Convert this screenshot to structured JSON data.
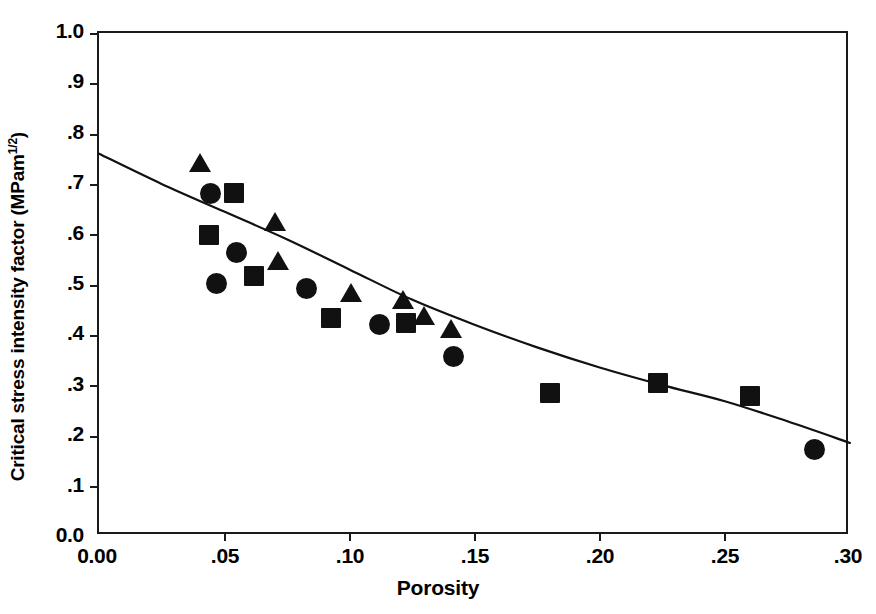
{
  "figure": {
    "title": "",
    "background": "#ffffff",
    "ink_color": "#111111"
  },
  "axes": {
    "x_title": "Porosity",
    "y_title_main": "Critical stress intensity factor   (MPam",
    "y_title_sup": "1/2",
    "y_title_close": ")",
    "x_ticks": [
      "0.00",
      ".05",
      ".10",
      ".15",
      ".20",
      ".25",
      ".30"
    ],
    "y_ticks": [
      "1.0",
      ".9",
      ".8",
      ".7",
      ".6",
      ".5",
      ".4",
      ".3",
      ".2",
      ".1",
      "0.0"
    ]
  },
  "chart_data": {
    "type": "scatter",
    "title": "",
    "xlabel": "Porosity",
    "ylabel": "Critical stress intensity factor (MPam^1/2)",
    "xlim": [
      0.0,
      0.3
    ],
    "ylim": [
      0.0,
      1.0
    ],
    "xticks": [
      0.0,
      0.05,
      0.1,
      0.15,
      0.2,
      0.25,
      0.3
    ],
    "yticks": [
      0.0,
      0.1,
      0.2,
      0.3,
      0.4,
      0.5,
      0.6,
      0.7,
      0.8,
      0.9,
      1.0
    ],
    "grid": false,
    "legend": "none",
    "series": [
      {
        "name": "triangles",
        "marker": "triangle",
        "points": [
          {
            "x": 0.0405,
            "y": 0.741
          },
          {
            "x": 0.0705,
            "y": 0.624
          },
          {
            "x": 0.0715,
            "y": 0.546
          },
          {
            "x": 0.1005,
            "y": 0.484
          },
          {
            "x": 0.1215,
            "y": 0.47
          },
          {
            "x": 0.13,
            "y": 0.437
          },
          {
            "x": 0.1405,
            "y": 0.412
          }
        ]
      },
      {
        "name": "circles",
        "marker": "circle",
        "points": [
          {
            "x": 0.0445,
            "y": 0.681
          },
          {
            "x": 0.055,
            "y": 0.563
          },
          {
            "x": 0.047,
            "y": 0.501
          },
          {
            "x": 0.083,
            "y": 0.492
          },
          {
            "x": 0.112,
            "y": 0.421
          },
          {
            "x": 0.1415,
            "y": 0.356
          },
          {
            "x": 0.286,
            "y": 0.171
          }
        ]
      },
      {
        "name": "squares",
        "marker": "square",
        "points": [
          {
            "x": 0.054,
            "y": 0.681
          },
          {
            "x": 0.044,
            "y": 0.599
          },
          {
            "x": 0.062,
            "y": 0.517
          },
          {
            "x": 0.0925,
            "y": 0.433
          },
          {
            "x": 0.1225,
            "y": 0.424
          },
          {
            "x": 0.18,
            "y": 0.284
          },
          {
            "x": 0.2235,
            "y": 0.305
          },
          {
            "x": 0.26,
            "y": 0.279
          }
        ]
      }
    ],
    "fit_curve": {
      "name": "fitted-trend-line",
      "style": "solid",
      "color": "#111111",
      "points": [
        {
          "x": 0.0,
          "y": 0.76
        },
        {
          "x": 0.025,
          "y": 0.7
        },
        {
          "x": 0.05,
          "y": 0.645
        },
        {
          "x": 0.075,
          "y": 0.59
        },
        {
          "x": 0.1,
          "y": 0.53
        },
        {
          "x": 0.125,
          "y": 0.47
        },
        {
          "x": 0.15,
          "y": 0.42
        },
        {
          "x": 0.175,
          "y": 0.375
        },
        {
          "x": 0.2,
          "y": 0.335
        },
        {
          "x": 0.225,
          "y": 0.3
        },
        {
          "x": 0.25,
          "y": 0.268
        },
        {
          "x": 0.275,
          "y": 0.228
        },
        {
          "x": 0.3,
          "y": 0.185
        }
      ]
    }
  }
}
